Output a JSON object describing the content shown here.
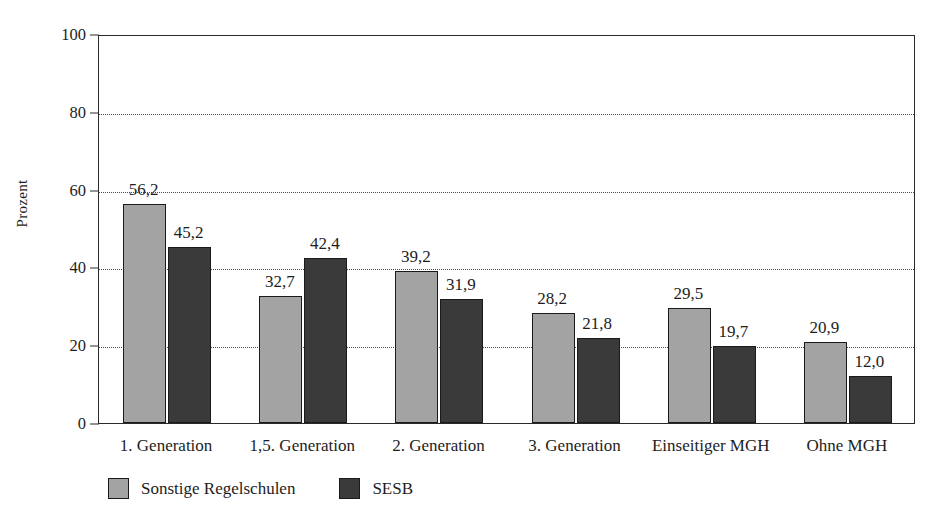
{
  "chart_data": {
    "type": "bar",
    "title": "",
    "xlabel": "",
    "ylabel": "Prozent",
    "ylim": [
      0,
      100
    ],
    "yticks": [
      0,
      20,
      40,
      60,
      80,
      100
    ],
    "grid": "horizontal-dotted",
    "legend_position": "bottom-left",
    "decimal_separator": ",",
    "categories": [
      "1. Generation",
      "1,5. Generation",
      "2. Generation",
      "3. Generation",
      "Einseitiger MGH",
      "Ohne MGH"
    ],
    "series": [
      {
        "name": "Sonstige Regelschulen",
        "color": "#a3a3a3",
        "values": [
          56.2,
          32.7,
          39.2,
          28.2,
          29.5,
          20.9
        ],
        "labels": [
          "56,2",
          "32,7",
          "39,2",
          "28,2",
          "29,5",
          "20,9"
        ]
      },
      {
        "name": "SESB",
        "color": "#3a3a3a",
        "values": [
          45.2,
          42.4,
          31.9,
          21.8,
          19.7,
          12.0
        ],
        "labels": [
          "45,2",
          "42,4",
          "31,9",
          "21,8",
          "19,7",
          "12,0"
        ]
      }
    ]
  },
  "axis": {
    "y_label": "Prozent",
    "y_tick_labels": [
      "0",
      "20",
      "40",
      "60",
      "80",
      "100"
    ]
  },
  "legend": {
    "items": [
      {
        "label": "Sonstige Regelschulen",
        "swatch": "light"
      },
      {
        "label": "SESB",
        "swatch": "dark"
      }
    ]
  }
}
